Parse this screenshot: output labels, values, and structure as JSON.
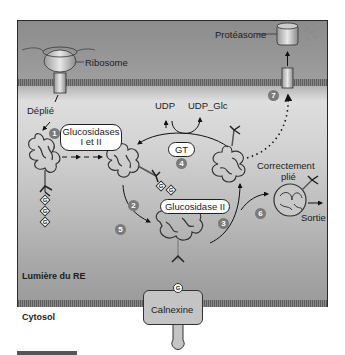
{
  "labels": {
    "ribosome": "Ribosome",
    "proteasome": "Protéasome",
    "unfolded": "Déplié",
    "udp": "UDP",
    "udp_glc": "UDP_Glc",
    "correctly_folded_line1": "Correctement",
    "correctly_folded_line2": "plié",
    "exit": "Sortie",
    "er_lumen": "Lumière du RE",
    "cytosol": "Cytosol"
  },
  "enzymes": {
    "glucosidases_line1": "Glucosidases",
    "glucosidases_line2": "I et II",
    "gt": "GT",
    "glucosidase_ii": "Glucosidase II",
    "calnexine": "Calnexine"
  },
  "steps": [
    "1",
    "2",
    "3",
    "4",
    "5",
    "6",
    "7"
  ],
  "glucose_marker": "G",
  "colors": {
    "frame_border": "#2a2a2a",
    "membrane": "#6e6e6e",
    "lumen": "#d6d6d6",
    "cytosol": "#a0a0a0",
    "badge": "#7a7a7a"
  }
}
